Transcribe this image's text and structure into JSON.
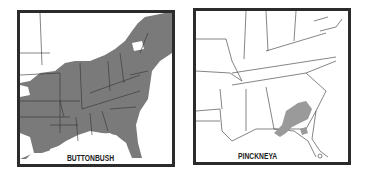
{
  "maps": [
    {
      "label": "BUTTONBUSH",
      "region": "Eastern United States",
      "range_color": "#7a7a7a",
      "description": "Range shaded across nearly all of the eastern US from the Great Lakes and New England south through Florida and west into Texas/Plains"
    },
    {
      "label": "PINCKNEYA",
      "region": "Southeastern United States",
      "range_color": "#9a9a9a",
      "description": "Small range shaded in southeastern Georgia and northern Florida, with a small outlier patch in north-central Florida"
    }
  ],
  "colors": {
    "border": "#2b2b2b",
    "state_lines": "#333333",
    "background": "#ffffff"
  }
}
